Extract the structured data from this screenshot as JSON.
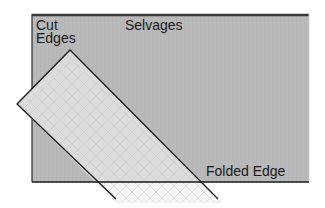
{
  "diagram": {
    "labels": {
      "cut_edges_line1": "Cut",
      "cut_edges_line2": "Edges",
      "selvages": "Selvages",
      "folded_edge": "Folded Edge"
    },
    "colors": {
      "fabric_fill": "#b8b8b8",
      "strip_fill": "#dedede",
      "strip_overhang_fill": "#f4f4f4",
      "outline": "#1a1a1a",
      "top_border": "#3a3a3a",
      "background": "#ffffff"
    },
    "shapes": {
      "fabric_rect": {
        "x": 32,
        "y": 14,
        "width": 277,
        "height": 168
      },
      "strip_apex": [
        70,
        50
      ],
      "strip_left_corner": [
        17,
        104
      ],
      "strip_right_edge_end": [
        218,
        199
      ],
      "strip_left_edge_end": [
        116,
        199
      ]
    }
  }
}
